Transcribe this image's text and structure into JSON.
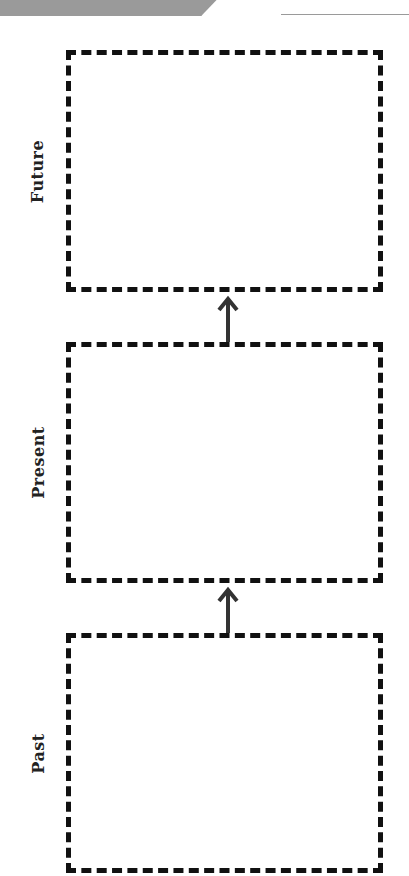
{
  "header": {
    "banner_text": "",
    "name_line": ""
  },
  "diagram": {
    "boxes": [
      {
        "label": "Future",
        "content": ""
      },
      {
        "label": "Present",
        "content": ""
      },
      {
        "label": "Past",
        "content": ""
      }
    ],
    "arrows": [
      {
        "from": "Present",
        "to": "Future",
        "icon": "arrow-up-icon"
      },
      {
        "from": "Past",
        "to": "Present",
        "icon": "arrow-up-icon"
      }
    ],
    "colors": {
      "border": "#111111",
      "arrow": "#333333",
      "banner": "#9a9a9a"
    }
  }
}
